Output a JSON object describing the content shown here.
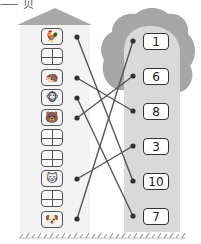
{
  "header": {
    "fragment": "⸺ 贝"
  },
  "colors": {
    "roof": "#a9a9a9",
    "canopy": "#a6a6a6",
    "trunk": "#d9d9d9",
    "column_bg": "#f2f2f2",
    "line": "#555555",
    "dot": "#333333",
    "grass": "#9a9a9a"
  },
  "left_column": {
    "boxes": [
      {
        "type": "animal",
        "icon": "rooster-icon",
        "glyph": "🐓",
        "connected": true
      },
      {
        "type": "blank"
      },
      {
        "type": "animal",
        "icon": "hedgehog-icon",
        "glyph": "🦔",
        "connected": true
      },
      {
        "type": "animal",
        "icon": "monkey-icon",
        "glyph": "🐵",
        "connected": true
      },
      {
        "type": "animal",
        "icon": "bear-icon",
        "glyph": "🐻",
        "connected": true
      },
      {
        "type": "blank"
      },
      {
        "type": "blank"
      },
      {
        "type": "animal",
        "icon": "cat-icon",
        "glyph": "🐱",
        "connected": true
      },
      {
        "type": "blank"
      },
      {
        "type": "animal",
        "icon": "dog-icon",
        "glyph": "🐶",
        "connected": true
      }
    ]
  },
  "right_column": {
    "numbers": [
      "1",
      "6",
      "8",
      "3",
      "10",
      "7"
    ]
  },
  "connections": [
    {
      "from": "rooster",
      "to": "10"
    },
    {
      "from": "hedgehog",
      "to": "8"
    },
    {
      "from": "monkey",
      "to": "7"
    },
    {
      "from": "bear",
      "to": "6"
    },
    {
      "from": "cat",
      "to": "3"
    },
    {
      "from": "dog",
      "to": "1"
    }
  ]
}
